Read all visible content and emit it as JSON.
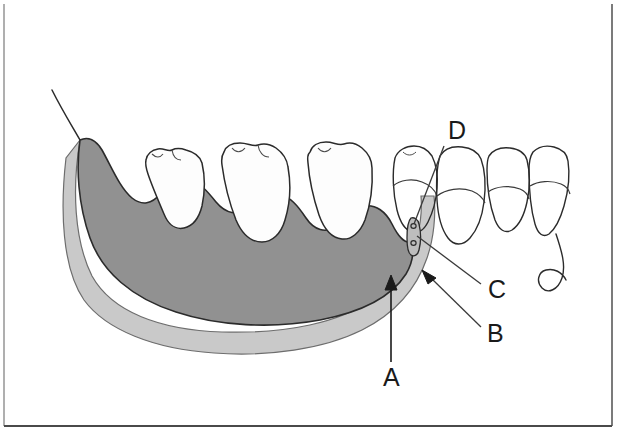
{
  "figure": {
    "kind": "anatomical-line-diagram",
    "canvas": {
      "width": 618,
      "height": 441
    },
    "background_color": "#ffffff",
    "border": {
      "visible": true,
      "color": "#3d3d3d",
      "left_x": 4,
      "right_x": 612,
      "bottom_y": 426,
      "top_y": 4
    }
  },
  "colors": {
    "bone_fill": "#919191",
    "band_fill": "#c9c9c9",
    "tooth_fill": "#fdfdfd",
    "outline": "#2b2b2b",
    "leader_line": "#3a3a3a",
    "label_color": "#1a1a1a"
  },
  "labels": [
    {
      "id": "A",
      "text": "A",
      "x": 383,
      "y": 386,
      "leader": {
        "from": [
          391,
          362
        ],
        "to": [
          391,
          277
        ],
        "arrow": "up"
      },
      "points_to": "inferior-light-gray-band"
    },
    {
      "id": "B",
      "text": "B",
      "x": 487,
      "y": 342,
      "leader": {
        "from": [
          481,
          327
        ],
        "to": [
          424,
          272
        ],
        "arrow": "upper-left"
      },
      "points_to": "posterior-light-gray-band"
    },
    {
      "id": "C",
      "text": "C",
      "x": 488,
      "y": 298,
      "leader": {
        "from": [
          481,
          284
        ],
        "to": [
          418,
          234
        ],
        "arrow": "none"
      },
      "points_to": "mental-foramen-canal"
    },
    {
      "id": "D",
      "text": "D",
      "x": 448,
      "y": 139,
      "leader": {
        "from": [
          444,
          146
        ],
        "to": [
          414,
          226
        ],
        "arrow": "none"
      },
      "points_to": "canal-upper-opening"
    }
  ],
  "teeth": {
    "shaded_count": 3,
    "outline_count": 4,
    "description": "Three posterior molars drawn solid white within shaded bone on the left, four anterior teeth drawn as outlines with exposed roots on the right"
  },
  "structures": [
    {
      "name": "mandible-bone",
      "fill": "bone_fill",
      "note": "large shaded jaw body with ramus rising at upper left"
    },
    {
      "name": "inferior-light-gray-band",
      "fill": "band_fill",
      "note": "light gray band along the inferior-posterior border"
    },
    {
      "name": "mental-foramen-canal",
      "fill": "band_fill",
      "note": "small elongated canal with two small circular openings"
    },
    {
      "name": "coronoid-ramus-line",
      "fill": "none",
      "note": "thin curved line extending to upper left beyond bone"
    }
  ]
}
